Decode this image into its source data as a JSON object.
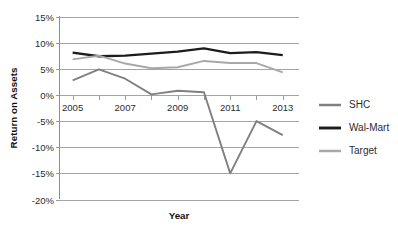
{
  "chart_data": {
    "type": "line",
    "title": "",
    "xlabel": "Year",
    "ylabel": "Return on Assets",
    "x": [
      2005,
      2006,
      2007,
      2008,
      2009,
      2010,
      2011,
      2012,
      2013
    ],
    "xtick_labels": [
      "2005",
      "2007",
      "2009",
      "2011",
      "2013"
    ],
    "xtick_values": [
      2005,
      2007,
      2009,
      2011,
      2013
    ],
    "xlim": [
      2004.5,
      2013.6
    ],
    "ylim": [
      -20,
      15
    ],
    "ytick_labels": [
      "15%",
      "10%",
      "5%",
      "0%",
      "-5%",
      "-10%",
      "-15%",
      "-20%"
    ],
    "ytick_values": [
      15,
      10,
      5,
      0,
      -5,
      -10,
      -15,
      -20
    ],
    "grid": true,
    "legend_position": "right",
    "series": [
      {
        "name": "SHC",
        "color": "#808080",
        "width": 1.9,
        "values": [
          2.8,
          4.9,
          3.1,
          0.1,
          0.8,
          0.5,
          -15.0,
          -5.0,
          -7.7
        ]
      },
      {
        "name": "Wal-Mart",
        "color": "#1c1c1c",
        "width": 2.3,
        "values": [
          8.1,
          7.4,
          7.5,
          7.9,
          8.3,
          8.9,
          8.0,
          8.2,
          7.6
        ]
      },
      {
        "name": "Target",
        "color": "#a8a8a8",
        "width": 1.9,
        "values": [
          6.8,
          7.5,
          6.0,
          5.1,
          5.3,
          6.5,
          6.1,
          6.1,
          4.3
        ]
      }
    ]
  },
  "legend": {
    "items": [
      {
        "label": "SHC"
      },
      {
        "label": "Wal-Mart"
      },
      {
        "label": "Target"
      }
    ]
  }
}
